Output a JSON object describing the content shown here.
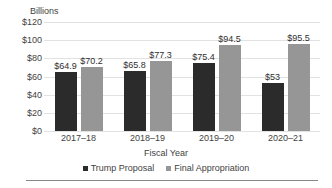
{
  "chart_data": {
    "type": "bar",
    "title": "",
    "xlabel": "Fiscal Year",
    "ylabel": "Billions",
    "categories": [
      "2017–18",
      "2018–19",
      "2019–20",
      "2020–21"
    ],
    "series": [
      {
        "name": "Trump Proposal",
        "color": "#2b2b2b",
        "values": [
          64.9,
          65.8,
          75.4,
          53
        ],
        "labels": [
          "$64.9",
          "$65.8",
          "$75.4",
          "$53"
        ]
      },
      {
        "name": "Final Appropriation",
        "color": "#969696",
        "values": [
          70.2,
          77.3,
          94.5,
          95.5
        ],
        "labels": [
          "$70.2",
          "$77.3",
          "$94.5",
          "$95.5"
        ]
      }
    ],
    "ylim": [
      0,
      120
    ],
    "yticks": [
      120,
      100,
      80,
      60,
      40,
      20,
      0
    ],
    "ytick_labels": [
      "$120",
      "$100",
      "$80",
      "$60",
      "$40",
      "$20",
      "$0"
    ],
    "grid": true,
    "legend_position": "bottom",
    "gridline_color": "#e2e2e2",
    "rule_color": "#888888"
  }
}
